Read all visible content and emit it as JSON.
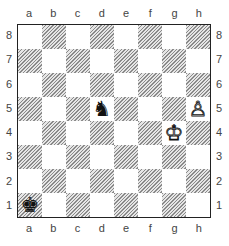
{
  "diagram": {
    "files": [
      "a",
      "b",
      "c",
      "d",
      "e",
      "f",
      "g",
      "h"
    ],
    "ranks": [
      "8",
      "7",
      "6",
      "5",
      "4",
      "3",
      "2",
      "1"
    ],
    "pieces": [
      {
        "square": "d5",
        "piece": "knight",
        "color": "black",
        "glyph": "♞"
      },
      {
        "square": "h5",
        "piece": "pawn",
        "color": "white",
        "glyph": "♙"
      },
      {
        "square": "g4",
        "piece": "king",
        "color": "white",
        "glyph": "♔"
      },
      {
        "square": "a1",
        "piece": "king",
        "color": "black",
        "glyph": "♚"
      }
    ]
  }
}
